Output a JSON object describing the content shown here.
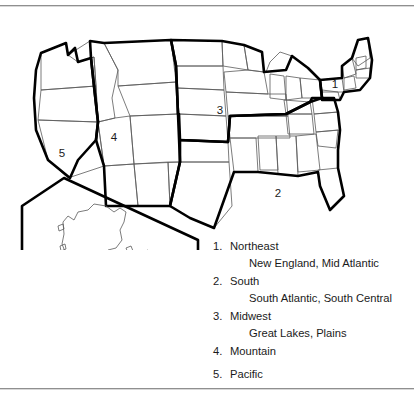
{
  "figure": {
    "name": "united-states-census-regions-map",
    "top_rule": "horizontal-rule",
    "bottom_rule": "horizontal-rule"
  },
  "map": {
    "title": "",
    "inset_label": "alaska-hawaii-inset",
    "region_labels": [
      {
        "id": "1",
        "x": 327,
        "y": 74
      },
      {
        "id": "2",
        "x": 270,
        "y": 183
      },
      {
        "id": "3",
        "x": 212,
        "y": 100
      },
      {
        "id": "4",
        "x": 106,
        "y": 127
      },
      {
        "id": "5",
        "x": 54,
        "y": 143
      }
    ]
  },
  "legend": {
    "items": [
      {
        "num": "1.",
        "name": "Northeast",
        "sub": "New England, Mid Atlantic"
      },
      {
        "num": "2.",
        "name": "South",
        "sub": "South Atlantic, South Central"
      },
      {
        "num": "3.",
        "name": "Midwest",
        "sub": "Great Lakes, Plains"
      },
      {
        "num": "4.",
        "name": "Mountain",
        "sub": ""
      },
      {
        "num": "5.",
        "name": "Pacific",
        "sub": ""
      }
    ]
  },
  "colors": {
    "text": "#1a1a1a",
    "region_border": "#000000",
    "state_border": "#5a5a5a",
    "rule": "#8f8f8f",
    "background": "#ffffff"
  }
}
